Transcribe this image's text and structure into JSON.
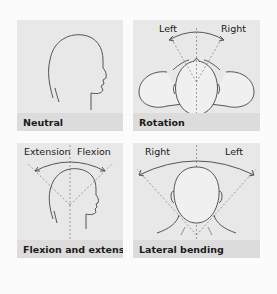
{
  "figure": {
    "panels": [
      {
        "id": "neutral",
        "caption": "Neutral",
        "directions": []
      },
      {
        "id": "rotation",
        "caption": "Rotation",
        "directions": [
          "Left",
          "Right"
        ]
      },
      {
        "id": "flexion-extension",
        "caption": "Flexion and extension",
        "directions": [
          "Extension",
          "Flexion"
        ]
      },
      {
        "id": "lateral-bending",
        "caption": "Lateral bending",
        "directions": [
          "Right",
          "Left"
        ]
      }
    ],
    "colors": {
      "background": "#fbfbfb",
      "panel": "#e8e8e8",
      "label_band": "#dcdcdc",
      "outline": "#555555",
      "head_fill": "#f0f0f0"
    }
  }
}
